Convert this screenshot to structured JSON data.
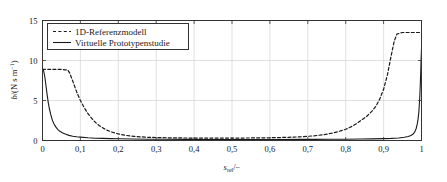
{
  "chart_data": {
    "type": "line",
    "title": "",
    "xlabel": "s_rel/-",
    "xlabel_parts": {
      "base": "s",
      "subscript": "rel",
      "tail": "/−"
    },
    "ylabel": "b/(N s m^-1)",
    "ylabel_parts": {
      "base": "b",
      "open": "/(N s m",
      "exponent": "−1",
      "close": ")"
    },
    "xlim": [
      0,
      1
    ],
    "ylim": [
      0,
      15
    ],
    "xticks": [
      0,
      0.1,
      0.2,
      0.3,
      0.4,
      0.5,
      0.6,
      0.7,
      0.8,
      0.9,
      1
    ],
    "xticklabels": [
      "0",
      "0,1",
      "0,2",
      "0,3",
      "0,4",
      "0,5",
      "0,6",
      "0,7",
      "0,8",
      "0,9",
      "1"
    ],
    "yticks": [
      0,
      5,
      10,
      15
    ],
    "yticklabels": [
      "0",
      "5",
      "10",
      "15"
    ],
    "grid": true,
    "grid_color": "#cccccc",
    "legend_position": "upper-left",
    "series": [
      {
        "name": "1D-Referenzmodell",
        "style": "dashed",
        "color": "#1a1a1a",
        "x": [
          0.0,
          0.01,
          0.02,
          0.03,
          0.04,
          0.05,
          0.06,
          0.067,
          0.072,
          0.08,
          0.09,
          0.1,
          0.11,
          0.12,
          0.13,
          0.14,
          0.15,
          0.16,
          0.17,
          0.18,
          0.19,
          0.2,
          0.22,
          0.24,
          0.26,
          0.28,
          0.3,
          0.34,
          0.38,
          0.42,
          0.46,
          0.5,
          0.54,
          0.58,
          0.62,
          0.65,
          0.68,
          0.7,
          0.72,
          0.74,
          0.76,
          0.78,
          0.8,
          0.82,
          0.84,
          0.855,
          0.87,
          0.88,
          0.89,
          0.9,
          0.91,
          0.92,
          0.928,
          0.935,
          0.95,
          0.97,
          0.99,
          1.0
        ],
        "y": [
          8.9,
          8.9,
          8.9,
          8.9,
          8.9,
          8.88,
          8.84,
          8.8,
          8.4,
          7.4,
          6.1,
          5.0,
          4.1,
          3.35,
          2.75,
          2.25,
          1.85,
          1.55,
          1.3,
          1.1,
          0.95,
          0.82,
          0.64,
          0.52,
          0.45,
          0.4,
          0.37,
          0.33,
          0.31,
          0.3,
          0.3,
          0.3,
          0.31,
          0.33,
          0.36,
          0.4,
          0.46,
          0.52,
          0.6,
          0.72,
          0.88,
          1.1,
          1.4,
          1.85,
          2.5,
          3.0,
          3.7,
          4.3,
          5.2,
          6.4,
          8.2,
          10.6,
          12.4,
          13.3,
          13.5,
          13.5,
          13.5,
          13.5
        ]
      },
      {
        "name": "Virtuelle Prototypenstudie",
        "style": "solid",
        "color": "#1a1a1a",
        "x": [
          0.0,
          0.003,
          0.006,
          0.009,
          0.012,
          0.015,
          0.018,
          0.022,
          0.026,
          0.03,
          0.035,
          0.04,
          0.046,
          0.052,
          0.06,
          0.07,
          0.08,
          0.09,
          0.1,
          0.12,
          0.14,
          0.16,
          0.18,
          0.2,
          0.24,
          0.28,
          0.32,
          0.38,
          0.44,
          0.5,
          0.56,
          0.62,
          0.68,
          0.72,
          0.76,
          0.8,
          0.84,
          0.87,
          0.9,
          0.92,
          0.94,
          0.955,
          0.965,
          0.972,
          0.978,
          0.982,
          0.986,
          0.989,
          0.991,
          0.993,
          0.995,
          0.996,
          0.997,
          0.998,
          0.999,
          1.0
        ],
        "y": [
          8.9,
          8.7,
          8.0,
          6.9,
          5.8,
          4.8,
          4.0,
          3.2,
          2.55,
          2.1,
          1.7,
          1.4,
          1.15,
          0.98,
          0.8,
          0.64,
          0.54,
          0.47,
          0.42,
          0.34,
          0.29,
          0.26,
          0.23,
          0.21,
          0.18,
          0.16,
          0.15,
          0.14,
          0.13,
          0.13,
          0.13,
          0.13,
          0.14,
          0.14,
          0.15,
          0.16,
          0.18,
          0.2,
          0.23,
          0.26,
          0.32,
          0.4,
          0.5,
          0.62,
          0.82,
          1.05,
          1.5,
          2.1,
          2.7,
          3.6,
          5.0,
          6.0,
          7.2,
          8.6,
          10.2,
          11.5
        ]
      }
    ],
    "legend": [
      {
        "label": "1D-Referenzmodell",
        "style": "dashed"
      },
      {
        "label": "Virtuelle Prototypenstudie",
        "style": "solid"
      }
    ]
  }
}
